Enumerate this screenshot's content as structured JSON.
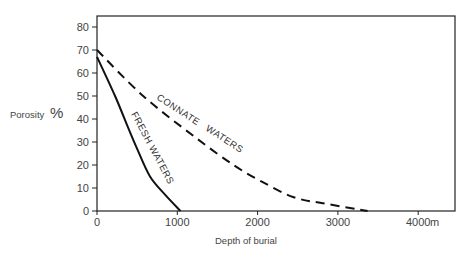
{
  "chart_data": {
    "type": "line",
    "title": "",
    "xlabel": "Depth of burial",
    "xunit": "m",
    "ylabel": "Porosity %",
    "xlim": [
      0,
      4700
    ],
    "ylim": [
      0,
      85
    ],
    "xticks": [
      0,
      1000,
      2000,
      3000,
      4000
    ],
    "xtick_labels": [
      "0",
      "1000",
      "2000",
      "3000",
      "4000"
    ],
    "yticks": [
      0,
      10,
      20,
      30,
      40,
      50,
      60,
      70,
      80
    ],
    "ytick_labels": [
      "0",
      "10",
      "20",
      "30",
      "40",
      "50",
      "60",
      "70",
      "80"
    ],
    "grid": false,
    "legend": "inline labels along curves",
    "series": [
      {
        "name": "FRESH WATERS",
        "style": "solid",
        "x": [
          0,
          225,
          390,
          500,
          660,
          850,
          1040
        ],
        "y": [
          67,
          50,
          36,
          27,
          15,
          7,
          0
        ]
      },
      {
        "name": "CONNATE WATERS",
        "style": "dashed",
        "x": [
          0,
          575,
          1225,
          1700,
          2040,
          2450,
          2875,
          3370
        ],
        "y": [
          70,
          50,
          32,
          20,
          13,
          6,
          3,
          0
        ]
      }
    ]
  },
  "labels": {
    "ylabel_text": "Porosity",
    "ylabel_unit_top": "o",
    "ylabel_unit_bottom": "o",
    "xlabel": "Depth of burial",
    "x_unit": "m",
    "fresh": "FRESH WATERS",
    "connate_1": "CONNATE",
    "connate_2": "WATERS"
  }
}
